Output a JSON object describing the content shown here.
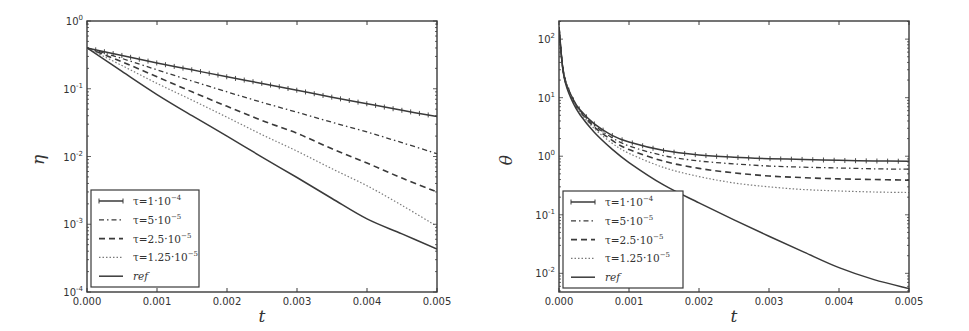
{
  "chart_data": [
    {
      "type": "line",
      "panel": "left",
      "title": "",
      "xlabel": "t",
      "ylabel": "η",
      "yscale": "log",
      "xlim": [
        0.0,
        0.005
      ],
      "ylim": [
        0.0001,
        1.0
      ],
      "grid": false,
      "legend_position": "lower left",
      "xticks": [
        0.0,
        0.001,
        0.002,
        0.003,
        0.004,
        0.005
      ],
      "xtick_labels": [
        "0.000",
        "0.001",
        "0.002",
        "0.003",
        "0.004",
        "0.005"
      ],
      "yticks": [
        1.0,
        0.1,
        0.01,
        0.001,
        0.0001
      ],
      "ytick_labels": [
        [
          "10",
          "0"
        ],
        [
          "10",
          "-1"
        ],
        [
          "10",
          "-2"
        ],
        [
          "10",
          "-3"
        ],
        [
          "10",
          "-4"
        ]
      ],
      "x": [
        0.0,
        0.0005,
        0.001,
        0.0015,
        0.002,
        0.0025,
        0.003,
        0.0035,
        0.004,
        0.0045,
        0.005
      ],
      "series": [
        {
          "name": "τ=1·10^-4",
          "label": [
            "τ=1·10",
            "−4"
          ],
          "style": "solid-marked",
          "values": [
            0.4,
            0.31,
            0.24,
            0.19,
            0.15,
            0.12,
            0.095,
            0.075,
            0.06,
            0.048,
            0.039
          ]
        },
        {
          "name": "τ=5·10^-5",
          "label": [
            "τ=5·10",
            "−5"
          ],
          "style": "dashdot",
          "values": [
            0.4,
            0.28,
            0.19,
            0.13,
            0.09,
            0.063,
            0.045,
            0.032,
            0.023,
            0.016,
            0.011
          ]
        },
        {
          "name": "τ=2.5·10^-5",
          "label": [
            "τ=2.5·10",
            "−5"
          ],
          "style": "dashed",
          "values": [
            0.4,
            0.25,
            0.15,
            0.09,
            0.055,
            0.034,
            0.022,
            0.013,
            0.008,
            0.0048,
            0.003
          ]
        },
        {
          "name": "τ=1.25·10^-5",
          "label": [
            "τ=1.25·10",
            "−5"
          ],
          "style": "dotted",
          "values": [
            0.4,
            0.22,
            0.12,
            0.068,
            0.038,
            0.021,
            0.012,
            0.0066,
            0.0037,
            0.0019,
            0.00093
          ]
        },
        {
          "name": "ref",
          "label": [
            "ref",
            ""
          ],
          "style": "solid",
          "values": [
            0.4,
            0.18,
            0.082,
            0.04,
            0.02,
            0.0098,
            0.0049,
            0.0024,
            0.0012,
            0.00072,
            0.00043
          ]
        }
      ]
    },
    {
      "type": "line",
      "panel": "right",
      "title": "",
      "xlabel": "t",
      "ylabel": "θ",
      "yscale": "log",
      "xlim": [
        0.0,
        0.005
      ],
      "ylim": [
        0.0048,
        204
      ],
      "grid": false,
      "legend_position": "lower left",
      "xticks": [
        0.0,
        0.001,
        0.002,
        0.003,
        0.004,
        0.005
      ],
      "xtick_labels": [
        "0.000",
        "0.001",
        "0.002",
        "0.003",
        "0.004",
        "0.005"
      ],
      "yticks": [
        100,
        10,
        1,
        0.1,
        0.01
      ],
      "ytick_labels": [
        [
          "10",
          "2"
        ],
        [
          "10",
          "1"
        ],
        [
          "10",
          "0"
        ],
        [
          "10",
          "-1"
        ],
        [
          "10",
          "-2"
        ]
      ],
      "x": [
        0.0,
        5e-05,
        0.0001,
        0.0002,
        0.0003,
        0.0005,
        0.00075,
        0.001,
        0.0015,
        0.002,
        0.0025,
        0.003,
        0.0035,
        0.004,
        0.0045,
        0.005
      ],
      "series": [
        {
          "name": "τ=1·10^-4",
          "label": [
            "τ=1·10",
            "−4"
          ],
          "style": "solid-marked",
          "values": [
            160,
            35,
            18,
            9.5,
            6.2,
            3.6,
            2.3,
            1.75,
            1.25,
            1.05,
            0.96,
            0.91,
            0.88,
            0.85,
            0.83,
            0.82
          ]
        },
        {
          "name": "τ=5·10^-5",
          "label": [
            "τ=5·10",
            "−5"
          ],
          "style": "dashdot",
          "values": [
            160,
            35,
            18,
            9.2,
            6.0,
            3.4,
            2.1,
            1.5,
            1.02,
            0.83,
            0.74,
            0.68,
            0.65,
            0.63,
            0.61,
            0.6
          ]
        },
        {
          "name": "τ=2.5·10^-5",
          "label": [
            "τ=2.5·10",
            "−5"
          ],
          "style": "dashed",
          "values": [
            160,
            35,
            17.5,
            9.0,
            5.8,
            3.2,
            1.9,
            1.3,
            0.82,
            0.62,
            0.52,
            0.46,
            0.43,
            0.41,
            0.4,
            0.39
          ]
        },
        {
          "name": "τ=1.25·10^-5",
          "label": [
            "τ=1.25·10",
            "−5"
          ],
          "style": "dotted",
          "values": [
            160,
            35,
            17,
            8.7,
            5.6,
            3.0,
            1.7,
            1.12,
            0.64,
            0.45,
            0.35,
            0.3,
            0.27,
            0.255,
            0.245,
            0.24
          ]
        },
        {
          "name": "ref",
          "label": [
            "ref",
            ""
          ],
          "style": "solid",
          "values": [
            160,
            34,
            16.5,
            8.2,
            5.1,
            2.6,
            1.35,
            0.78,
            0.32,
            0.16,
            0.082,
            0.043,
            0.023,
            0.0125,
            0.0078,
            0.0055
          ]
        }
      ]
    }
  ],
  "panels": [
    {
      "ylabel": "η",
      "xlabel": "t"
    },
    {
      "ylabel": "θ",
      "xlabel": "t"
    }
  ],
  "colors": {
    "axes": "#3a3a3a",
    "series": "#3a3a3a",
    "dotted": "#7a7a7a",
    "text": "#333333",
    "background": "#ffffff"
  }
}
